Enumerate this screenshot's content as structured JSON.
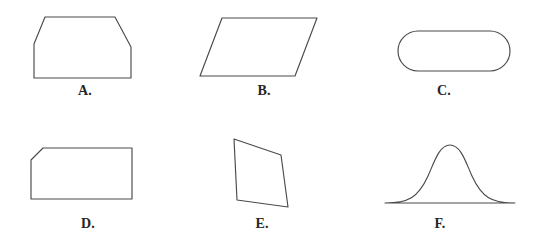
{
  "page": {
    "background_color": "#ffffff",
    "stroke_color": "#4a4a4a",
    "label_color": "#262626",
    "width": 542,
    "height": 249
  },
  "figures": [
    {
      "id": "A",
      "label": "A.",
      "shape_name": "clipped-corner-hexagon",
      "description": "Rectangle with both top corners cut off (isosceles hexagon)",
      "label_x": 85,
      "label_y": 91
    },
    {
      "id": "B",
      "label": "B.",
      "shape_name": "parallelogram",
      "description": "Parallelogram slanting to the right",
      "label_x": 264,
      "label_y": 91
    },
    {
      "id": "C",
      "label": "C.",
      "shape_name": "stadium-rounded-rectangle",
      "description": "Horizontal pill / stadium shape with fully rounded ends",
      "label_x": 444,
      "label_y": 91
    },
    {
      "id": "D",
      "label": "D.",
      "shape_name": "single-clipped-corner-pentagon",
      "description": "Rectangle with only the top-left corner cut off",
      "label_x": 88,
      "label_y": 224
    },
    {
      "id": "E",
      "label": "E.",
      "shape_name": "tilted-quadrilateral",
      "description": "Narrow upright quadrilateral leaning to the right",
      "label_x": 262,
      "label_y": 224
    },
    {
      "id": "F",
      "label": "F.",
      "shape_name": "bell-curve-region",
      "description": "Bell curve (normal distribution) closed by a flat base line",
      "label_x": 440,
      "label_y": 224
    }
  ]
}
